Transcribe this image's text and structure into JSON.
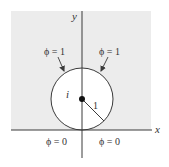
{
  "diagram": {
    "colors": {
      "region_fill": "#ececec",
      "line": "#3a3a3a",
      "text": "#333333",
      "background": "#ffffff"
    },
    "axes": {
      "x_label": "x",
      "y_label": "y"
    },
    "circle": {
      "center_label": "i",
      "radius_label": "1"
    },
    "boundary_labels": {
      "top_left": "ϕ = 1",
      "top_right": "ϕ = 1",
      "bottom_left": "ϕ = 0",
      "bottom_right": "ϕ = 0"
    }
  }
}
